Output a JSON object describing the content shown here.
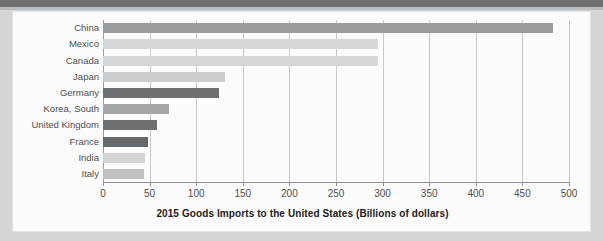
{
  "figure": {
    "name": "goods-imports-bar-chart"
  },
  "chart_data": {
    "type": "bar",
    "orientation": "horizontal",
    "title": "2015 Goods Imports to the United States (Billions of dollars)",
    "xlabel": "2015 Goods Imports to the United States (Billions of dollars)",
    "ylabel": "",
    "xlim": [
      0,
      500
    ],
    "ylim": null,
    "grid": true,
    "legend": null,
    "categories": [
      "China",
      "Mexico",
      "Canada",
      "Japan",
      "Germany",
      "Korea, South",
      "United Kingdom",
      "France",
      "India",
      "Italy"
    ],
    "values": [
      483,
      295,
      295,
      131,
      124,
      71,
      58,
      48,
      45,
      44
    ],
    "bar_colors": [
      "#9a9c9e",
      "#d5d7d8",
      "#d5d7d8",
      "#cbcdcf",
      "#6e7173",
      "#a4a6a8",
      "#6e7173",
      "#66696b",
      "#d2d4d5",
      "#bfc1c3"
    ],
    "xticks": [
      0,
      50,
      100,
      150,
      200,
      250,
      300,
      350,
      400,
      450,
      500
    ],
    "xtick_labels": [
      "0",
      "50",
      "100",
      "150",
      "200",
      "250",
      "300",
      "350",
      "400",
      "450",
      "500"
    ]
  },
  "colors": {
    "page_background": "#d4d6d7",
    "card_background": "#fcfcfc",
    "top_band": "#6f7375",
    "gridline": "#c6c8ca",
    "axis": "#8d9092",
    "text": "#4c4f51",
    "title_text": "#1e2021"
  }
}
